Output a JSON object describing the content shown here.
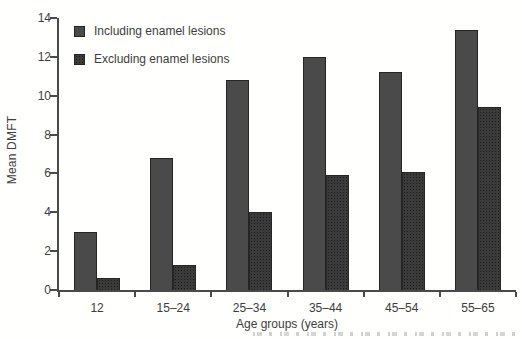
{
  "figure": {
    "background": "#ffffff",
    "text_color": "#3d3d3d",
    "axis_color": "#4a4a4a"
  },
  "chart_data": {
    "type": "bar",
    "title": "",
    "xlabel": "Age groups (years)",
    "ylabel": "Mean DMFT",
    "categories": [
      "12",
      "15–24",
      "25–34",
      "35–44",
      "45–54",
      "55–65"
    ],
    "series": [
      {
        "name": "Including enamel lesions",
        "color": "#4a4a4a",
        "values": [
          3.0,
          6.8,
          10.8,
          12.0,
          11.2,
          13.4
        ]
      },
      {
        "name": "Excluding enamel lesions",
        "color": "#3b3b3b",
        "values": [
          0.6,
          1.3,
          4.0,
          5.9,
          6.1,
          9.4
        ]
      }
    ],
    "ylim": [
      0,
      14
    ],
    "yticks": [
      0,
      2,
      4,
      6,
      8,
      10,
      12,
      14
    ],
    "legend_position": "top-left",
    "grid": false,
    "bar_width_px": 23
  },
  "cropped_caption": {
    "visible": true,
    "legible": false
  }
}
